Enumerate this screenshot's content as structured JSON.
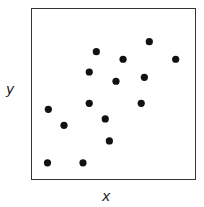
{
  "chart_data": {
    "type": "scatter",
    "title": "",
    "xlabel": "x",
    "ylabel": "y",
    "xlim": [
      0,
      10
    ],
    "ylim": [
      0,
      10
    ],
    "grid": false,
    "legend": null,
    "ticks": "none",
    "marker_color": "#111111",
    "points": [
      {
        "x": 1.0,
        "y": 1.0
      },
      {
        "x": 3.15,
        "y": 1.0
      },
      {
        "x": 4.75,
        "y": 2.27
      },
      {
        "x": 2.0,
        "y": 3.18
      },
      {
        "x": 4.5,
        "y": 3.55
      },
      {
        "x": 1.05,
        "y": 4.11
      },
      {
        "x": 3.53,
        "y": 4.46
      },
      {
        "x": 6.68,
        "y": 4.46
      },
      {
        "x": 5.15,
        "y": 5.74
      },
      {
        "x": 6.87,
        "y": 5.97
      },
      {
        "x": 3.53,
        "y": 6.28
      },
      {
        "x": 5.58,
        "y": 7.02
      },
      {
        "x": 8.77,
        "y": 7.02
      },
      {
        "x": 3.96,
        "y": 7.46
      },
      {
        "x": 7.17,
        "y": 8.04
      }
    ]
  },
  "labels": {
    "x": "x",
    "y": "y"
  }
}
